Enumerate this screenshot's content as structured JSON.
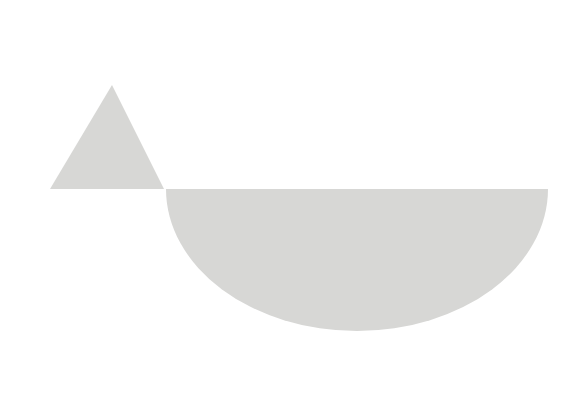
{
  "canvas": {
    "width": 585,
    "height": 405,
    "background_color": "#ffffff",
    "title": "Abstract geometric composition"
  },
  "palette": {
    "shape_fill": "#d7d7d5",
    "background": "#ffffff"
  },
  "shapes": [
    {
      "id": "triangle",
      "name": "gray-triangle",
      "type": "triangle",
      "fill": "#d7d7d5",
      "apex_x": 112,
      "apex_y": 85,
      "base_left_x": 50,
      "base_right_x": 164,
      "base_y": 189,
      "points": "112,85 164,189 50,189"
    },
    {
      "id": "half-ellipse",
      "name": "gray-half-ellipse",
      "type": "half-ellipse",
      "fill": "#d7d7d5",
      "center_x": 357,
      "flat_top_y": 189,
      "left_x": 166,
      "right_x": 548,
      "bottom_y": 331,
      "radius_x": 191,
      "radius_y": 142,
      "path": "M 166 189 L 548 189 A 191 142 0 0 1 166 189 Z"
    }
  ],
  "chart_data": {
    "type": "area",
    "subtitle": "",
    "xlabel": "",
    "ylabel": "",
    "xlim": [
      0,
      585
    ],
    "ylim": [
      0,
      405
    ],
    "grid": false,
    "legend": "none",
    "series": [
      {
        "name": "triangle",
        "shape": "triangle",
        "color": "#d7d7d5",
        "vertices": [
          [
            112,
            85
          ],
          [
            164,
            189
          ],
          [
            50,
            189
          ]
        ],
        "width": 114,
        "height": 104
      },
      {
        "name": "half-ellipse",
        "shape": "half-ellipse",
        "color": "#d7d7d5",
        "center": [
          357,
          189
        ],
        "semi_axis_x": 191,
        "semi_axis_y": 142,
        "orientation": "downward",
        "width": 382,
        "height": 142
      }
    ],
    "annotations": []
  }
}
